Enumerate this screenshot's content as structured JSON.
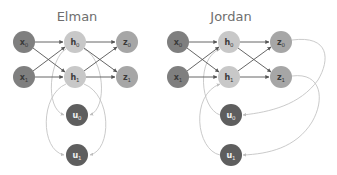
{
  "diagrams": [
    {
      "title": "Elman",
      "nodes": {
        "x0": {
          "base": "x",
          "sub": "0",
          "type": "input"
        },
        "x1": {
          "base": "x",
          "sub": "1",
          "type": "input"
        },
        "h0": {
          "base": "h",
          "sub": "0",
          "type": "hidden"
        },
        "h1": {
          "base": "h",
          "sub": "1",
          "type": "hidden"
        },
        "z0": {
          "base": "z",
          "sub": "0",
          "type": "output"
        },
        "z1": {
          "base": "z",
          "sub": "1",
          "type": "output"
        },
        "u0": {
          "base": "u",
          "sub": "0",
          "type": "context"
        },
        "u1": {
          "base": "u",
          "sub": "1",
          "type": "context"
        }
      },
      "feedback_from": "hidden"
    },
    {
      "title": "Jordan",
      "nodes": {
        "x0": {
          "base": "x",
          "sub": "0",
          "type": "input"
        },
        "x1": {
          "base": "x",
          "sub": "1",
          "type": "input"
        },
        "h0": {
          "base": "h",
          "sub": "0",
          "type": "hidden"
        },
        "h1": {
          "base": "h",
          "sub": "1",
          "type": "hidden"
        },
        "z0": {
          "base": "z",
          "sub": "0",
          "type": "output"
        },
        "z1": {
          "base": "z",
          "sub": "1",
          "type": "output"
        },
        "u0": {
          "base": "u",
          "sub": "0",
          "type": "context"
        },
        "u1": {
          "base": "u",
          "sub": "1",
          "type": "context"
        }
      },
      "feedback_from": "output"
    }
  ],
  "colors": {
    "input": "#7f7f7f",
    "hidden": "#c8c8c8",
    "output": "#a6a6a6",
    "context": "#5e5e5e",
    "input_text": "#3a3a3a",
    "hidden_text": "#3a3a3a",
    "output_text": "#3a3a3a",
    "context_text": "#f2f2f2",
    "edge": "#555555",
    "feedback_edge": "#c4c4c4"
  }
}
